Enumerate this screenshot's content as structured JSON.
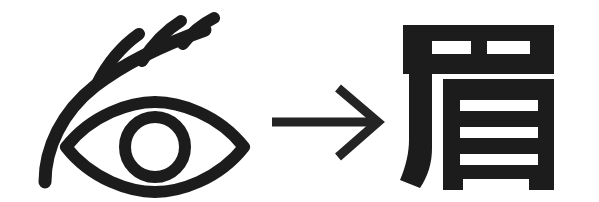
{
  "figure": {
    "background_color": "#ffffff",
    "ink_color": "#1c1c1c",
    "width": 599,
    "height": 202
  },
  "source_glyph": {
    "name": "eye-with-eyebrow-pictograph",
    "description": "Stylized eye with an arched eyebrow bearing three lashes",
    "parts": {
      "eyebrow": "arched brow stroke curving from lower left to upper right",
      "lashes": "three short upward prongs branching off the brow",
      "eye_outline": "almond lens shape",
      "iris": "circle outline at the center of the eye"
    }
  },
  "transform_arrow": {
    "name": "rightward-arrow",
    "symbol": "→",
    "direction": "right",
    "meaning": "develops into"
  },
  "result_glyph": {
    "name": "kanji-mayu",
    "character": "眉",
    "reading": "mayu",
    "meaning": "eyebrow",
    "components": {
      "radical": "尸",
      "body": "目"
    }
  },
  "accessibility": {
    "alt_text": "A pictograph of an eye with an eyebrow and three lashes, an arrow pointing right, and the kanji 眉 meaning eyebrow."
  }
}
